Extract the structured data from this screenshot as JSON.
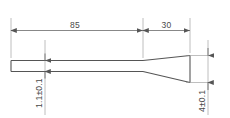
{
  "drawing": {
    "type": "engineering-part-drawing",
    "view": "side-profile",
    "background_color": "#ffffff",
    "line_color": "#555555",
    "thin_line_color": "#8a8a8a",
    "text_color": "#4a4a4a",
    "part": {
      "name": "tapered-probe",
      "description": "Thin parallel bar transitioning through a taper to a wider tip"
    },
    "dimensions": [
      {
        "id": "length-shank",
        "label": "85",
        "orientation": "horizontal",
        "nominal": 85,
        "tolerance": null,
        "region": "parallel-shank"
      },
      {
        "id": "length-taper",
        "label": "30",
        "orientation": "horizontal",
        "nominal": 30,
        "tolerance": null,
        "region": "taper"
      },
      {
        "id": "thickness-shank",
        "label": "1.1±0.1",
        "orientation": "vertical",
        "nominal": 1.1,
        "tolerance": 0.1,
        "region": "parallel-shank"
      },
      {
        "id": "thickness-tip",
        "label": "4±0.1",
        "orientation": "vertical",
        "nominal": 4,
        "tolerance": 0.1,
        "region": "tip"
      }
    ]
  }
}
